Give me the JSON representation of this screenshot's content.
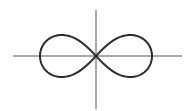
{
  "figure": {
    "curve": {
      "name": "lemniscate",
      "half_width": 56,
      "half_height": 21,
      "stroke_color": "#2a2a2a",
      "stroke_width": 2
    },
    "axes": {
      "origin": [
        96,
        56
      ],
      "x_axis": {
        "from": 13,
        "to": 182
      },
      "y_axis": {
        "from": 10,
        "to": 109
      },
      "stroke_color": "#555555",
      "stroke_width": 1
    },
    "background": "#ffffff"
  }
}
